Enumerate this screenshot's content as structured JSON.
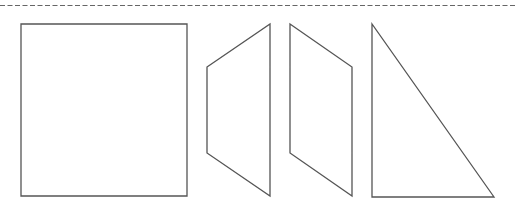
{
  "canvas": {
    "width": 529,
    "height": 209,
    "background": "#ffffff"
  },
  "style": {
    "stroke": "#555555",
    "stroke_width": 1.3,
    "dash_stroke": "#666666"
  },
  "cut_line": {
    "x1": 0,
    "y1": 5.5,
    "x2": 515,
    "y2": 5.5,
    "dasharray": "5 2.5"
  },
  "shapes": [
    {
      "name": "square",
      "points": "21,24 187,24 187,196 21,196"
    },
    {
      "name": "trapezoid-left",
      "points": "207,67 270,24 270,196 207,153"
    },
    {
      "name": "trapezoid-right",
      "points": "290,24 352,67 352,196 290,153"
    },
    {
      "name": "right-triangle",
      "points": "372,24 372,197 494,197"
    }
  ]
}
